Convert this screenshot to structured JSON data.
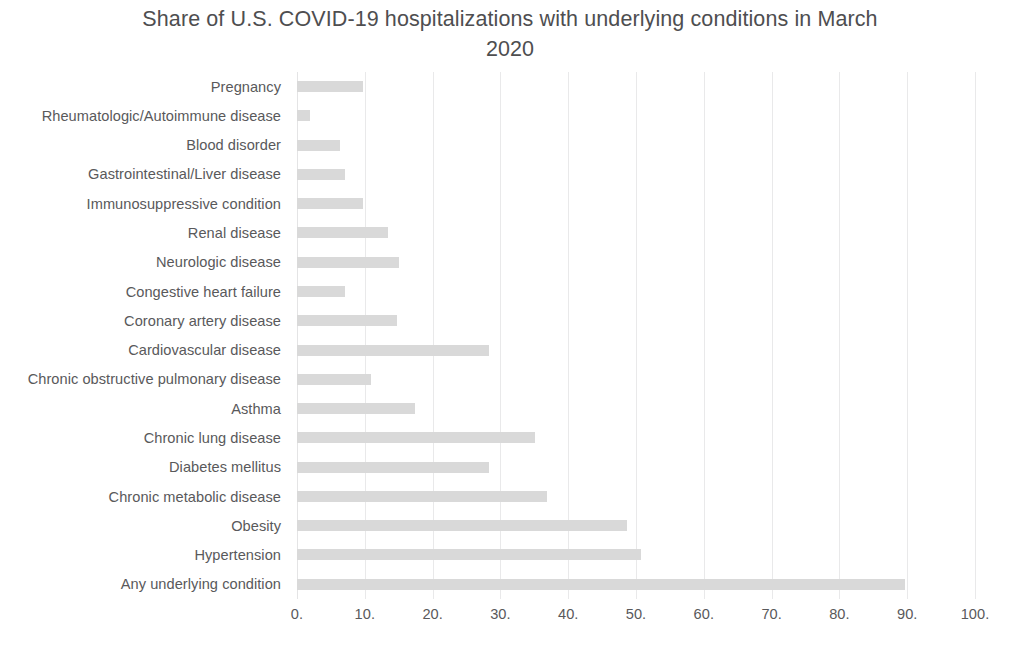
{
  "chart_data": {
    "type": "bar",
    "orientation": "horizontal",
    "title": "Share of U.S. COVID-19 hospitalizations with underlying conditions in March\n2020",
    "xlabel": "",
    "ylabel": "",
    "xlim": [
      0,
      100
    ],
    "xtick_labels": [
      "0.",
      "10.",
      "20.",
      "30.",
      "40.",
      "50.",
      "60.",
      "70.",
      "80.",
      "90.",
      "100."
    ],
    "xtick_values": [
      0,
      10,
      20,
      30,
      40,
      50,
      60,
      70,
      80,
      90,
      100
    ],
    "grid": "vertical",
    "legend": "none",
    "bar_color": "#d9d9d9",
    "categories": [
      "Pregnancy",
      "Rheumatologic/Autoimmune disease",
      "Blood disorder",
      "Gastrointestinal/Liver disease",
      "Immunosuppressive condition",
      "Renal disease",
      "Neurologic disease",
      "Congestive heart failure",
      "Coronary artery disease",
      "Cardiovascular disease",
      "Chronic obstructive pulmonary disease",
      "Asthma",
      "Chronic lung disease",
      "Diabetes mellitus",
      "Chronic metabolic disease",
      "Obesity",
      "Hypertension",
      "Any underlying condition"
    ],
    "values": [
      9.7,
      1.9,
      6.3,
      7.1,
      9.7,
      13.4,
      15.0,
      7.1,
      14.7,
      28.3,
      10.9,
      17.4,
      35.1,
      28.3,
      36.9,
      48.7,
      50.7,
      89.7
    ]
  }
}
